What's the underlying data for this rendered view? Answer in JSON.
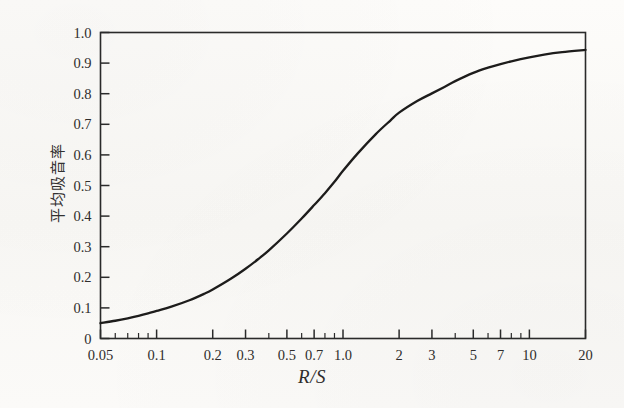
{
  "figure": {
    "background_color": "#fbfaf8",
    "ink_color": "#2a2a2a"
  },
  "axes": {
    "y_axis_label": "平均吸音率",
    "x_axis_title": "R/S"
  },
  "chart_data": {
    "type": "line",
    "title": "",
    "subtitle": "",
    "xlabel": "R/S",
    "ylabel": "平均吸音率",
    "xscale": "log",
    "yscale": "linear",
    "xlim": [
      0.05,
      20
    ],
    "ylim": [
      0,
      1.0
    ],
    "grid": false,
    "legend": "none",
    "x_tick_labels": [
      "0.05",
      "0.1",
      "0.2",
      "0.3",
      "0.5",
      "0.7",
      "1.0",
      "2",
      "3",
      "5",
      "7",
      "10",
      "20"
    ],
    "x_tick_values": [
      0.05,
      0.1,
      0.2,
      0.3,
      0.5,
      0.7,
      1.0,
      2,
      3,
      5,
      7,
      10,
      20
    ],
    "x_minor_ticks": [
      0.06,
      0.07,
      0.08,
      0.09,
      0.4,
      0.6,
      0.8,
      0.9,
      4,
      6,
      8,
      9
    ],
    "y_tick_labels": [
      "0",
      "0.1",
      "0.2",
      "0.3",
      "0.4",
      "0.5",
      "0.6",
      "0.7",
      "0.8",
      "0.9",
      "1.0"
    ],
    "y_tick_values": [
      0,
      0.1,
      0.2,
      0.3,
      0.4,
      0.5,
      0.6,
      0.7,
      0.8,
      0.9,
      1.0
    ],
    "series": [
      {
        "name": "average absorption coefficient",
        "color": "#1d1c1b",
        "line_width": 2.3,
        "x": [
          0.05,
          0.06,
          0.07,
          0.08,
          0.09,
          0.1,
          0.12,
          0.15,
          0.18,
          0.2,
          0.25,
          0.3,
          0.35,
          0.4,
          0.5,
          0.6,
          0.7,
          0.8,
          0.9,
          1.0,
          1.2,
          1.5,
          1.8,
          2.0,
          2.5,
          3.0,
          3.5,
          4.0,
          5.0,
          6.0,
          7.0,
          8.0,
          10.0,
          12.0,
          15.0,
          20.0
        ],
        "y": [
          0.05,
          0.058,
          0.066,
          0.074,
          0.082,
          0.09,
          0.104,
          0.125,
          0.146,
          0.16,
          0.195,
          0.228,
          0.259,
          0.288,
          0.343,
          0.392,
          0.436,
          0.475,
          0.512,
          0.548,
          0.605,
          0.668,
          0.713,
          0.738,
          0.776,
          0.801,
          0.822,
          0.841,
          0.868,
          0.885,
          0.897,
          0.906,
          0.919,
          0.928,
          0.936,
          0.943
        ]
      }
    ]
  }
}
